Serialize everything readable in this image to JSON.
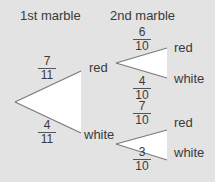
{
  "headers": {
    "first": "1st marble",
    "second": "2nd marble"
  },
  "colors": {
    "background": "#e3e3e3",
    "triangle_fill": "#ffffff",
    "branch_line": "#7a7a7a",
    "text": "#3a3a3a"
  },
  "first_level": {
    "red": {
      "label": "red",
      "prob": {
        "num": "7",
        "den": "11"
      }
    },
    "white": {
      "label": "white",
      "prob": {
        "num": "4",
        "den": "11"
      }
    }
  },
  "second_level": {
    "after_red": {
      "red": {
        "label": "red",
        "prob": {
          "num": "6",
          "den": "10"
        }
      },
      "white": {
        "label": "white",
        "prob": {
          "num": "4",
          "den": "10"
        }
      }
    },
    "after_white": {
      "red": {
        "label": "red",
        "prob": {
          "num": "7",
          "den": "10"
        }
      },
      "white": {
        "label": "white",
        "prob": {
          "num": "3",
          "den": "10"
        }
      }
    }
  }
}
